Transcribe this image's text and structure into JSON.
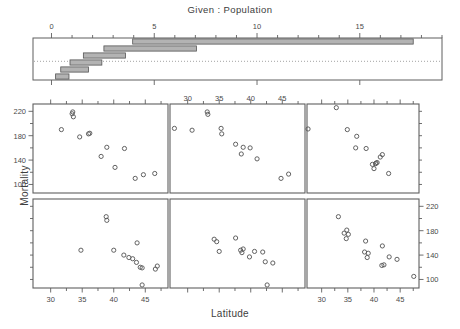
{
  "given_panel": {
    "title": "Given :  Population",
    "axis": {
      "ticks": [
        0,
        5,
        10,
        15
      ],
      "range": [
        -0.9,
        19.0
      ],
      "minor_tick_step": 1
    },
    "intervals": [
      {
        "min": 3.95,
        "max": 17.6,
        "row": 1
      },
      {
        "min": 2.55,
        "max": 7.05,
        "row": 2
      },
      {
        "min": 1.55,
        "max": 3.6,
        "row": 3
      },
      {
        "min": 0.9,
        "max": 2.45,
        "row": 4
      },
      {
        "min": 0.45,
        "max": 1.8,
        "row": 5
      },
      {
        "min": 0.2,
        "max": 0.85,
        "row": 6
      }
    ],
    "bar_fill": "#b3b3b3",
    "bar_stroke": "#555555",
    "dotted_line_color": "#8a8a8a"
  },
  "chart_data": {
    "type": "scatter",
    "plot_kind": "coplot",
    "title": "Given :  Population",
    "xlabel": "Latitude",
    "ylabel": "Mortality",
    "xlim": [
      27.2,
      48.6
    ],
    "ylim": [
      86,
      232
    ],
    "xticks": [
      30,
      35,
      40,
      45
    ],
    "yticks": [
      100,
      140,
      180,
      220
    ],
    "grid": false,
    "conditioning_variable": "Population",
    "point_marker": "open-circle",
    "point_color": "#5a5a5a",
    "panels": [
      {
        "row": 2,
        "col": 1,
        "index": 1,
        "cond_interval": [
          0.2,
          0.85
        ],
        "x_axis_labelled": true,
        "x_axis_side": "bottom",
        "y_axis_labelled": false,
        "points": [
          [
            34.8,
            148
          ],
          [
            38.8,
            203
          ],
          [
            38.9,
            197
          ],
          [
            40.0,
            148
          ],
          [
            41.6,
            140
          ],
          [
            42.4,
            136
          ],
          [
            43.0,
            134
          ],
          [
            43.6,
            128
          ],
          [
            43.7,
            160
          ],
          [
            44.2,
            120
          ],
          [
            44.5,
            119
          ],
          [
            44.5,
            91
          ],
          [
            46.6,
            117
          ],
          [
            46.9,
            122
          ]
        ]
      },
      {
        "row": 2,
        "col": 2,
        "index": 2,
        "cond_interval": [
          0.45,
          1.8
        ],
        "x_axis_labelled": false,
        "y_axis_labelled": false,
        "points": [
          [
            34.2,
            166
          ],
          [
            34.6,
            162
          ],
          [
            35.0,
            146
          ],
          [
            37.6,
            168
          ],
          [
            38.4,
            148
          ],
          [
            38.6,
            144
          ],
          [
            38.8,
            150
          ],
          [
            39.8,
            137
          ],
          [
            40.6,
            146
          ],
          [
            41.9,
            145
          ],
          [
            42.3,
            129
          ],
          [
            43.5,
            127
          ],
          [
            42.6,
            91
          ]
        ]
      },
      {
        "row": 2,
        "col": 3,
        "index": 3,
        "cond_interval": [
          0.9,
          2.45
        ],
        "x_axis_labelled": true,
        "x_axis_side": "bottom",
        "y_axis_labelled": true,
        "y_axis_side": "right",
        "points": [
          [
            33.2,
            203
          ],
          [
            34.3,
            176
          ],
          [
            34.8,
            181
          ],
          [
            35.1,
            174
          ],
          [
            34.7,
            167
          ],
          [
            38.4,
            163
          ],
          [
            38.2,
            145
          ],
          [
            38.9,
            143
          ],
          [
            38.7,
            136
          ],
          [
            41.6,
            155
          ],
          [
            41.5,
            123
          ],
          [
            41.9,
            124
          ],
          [
            42.9,
            137
          ],
          [
            44.4,
            133
          ],
          [
            47.6,
            105
          ]
        ]
      },
      {
        "row": 1,
        "col": 1,
        "index": 4,
        "cond_interval": [
          1.55,
          3.6
        ],
        "x_axis_labelled": false,
        "y_axis_labelled": true,
        "y_axis_side": "left",
        "points": [
          [
            31.7,
            190
          ],
          [
            33.4,
            216
          ],
          [
            33.5,
            219
          ],
          [
            33.6,
            211
          ],
          [
            34.6,
            178
          ],
          [
            36.0,
            183
          ],
          [
            36.2,
            184
          ],
          [
            38.0,
            146
          ],
          [
            38.9,
            161
          ],
          [
            40.2,
            128
          ],
          [
            41.7,
            159
          ],
          [
            43.4,
            110
          ],
          [
            44.7,
            116
          ],
          [
            46.5,
            118
          ]
        ]
      },
      {
        "row": 1,
        "col": 2,
        "index": 5,
        "cond_interval": [
          2.55,
          7.05
        ],
        "x_axis_labelled": false,
        "y_axis_labelled": false,
        "x_axis_top_labelled": true,
        "points": [
          [
            27.9,
            192
          ],
          [
            30.7,
            189
          ],
          [
            33.1,
            219
          ],
          [
            33.2,
            215
          ],
          [
            35.3,
            192
          ],
          [
            35.4,
            183
          ],
          [
            37.6,
            166
          ],
          [
            38.5,
            150
          ],
          [
            38.8,
            161
          ],
          [
            39.9,
            160
          ],
          [
            41.0,
            142
          ],
          [
            44.8,
            110
          ],
          [
            46.0,
            117
          ]
        ]
      },
      {
        "row": 1,
        "col": 3,
        "index": 6,
        "cond_interval": [
          3.95,
          17.6
        ],
        "x_axis_labelled": false,
        "y_axis_labelled": false,
        "points": [
          [
            27.4,
            191
          ],
          [
            32.8,
            226
          ],
          [
            34.9,
            190
          ],
          [
            36.7,
            179
          ],
          [
            36.5,
            160
          ],
          [
            38.5,
            159
          ],
          [
            39.7,
            133
          ],
          [
            40.0,
            126
          ],
          [
            40.3,
            134
          ],
          [
            40.4,
            135
          ],
          [
            40.6,
            136
          ],
          [
            41.2,
            145
          ],
          [
            41.6,
            149
          ],
          [
            42.8,
            118
          ]
        ]
      }
    ]
  },
  "axis_style": {
    "frame_color": "#5f5f5f",
    "tick_color": "#5f5f5f",
    "text_color": "#4a4a4a"
  }
}
